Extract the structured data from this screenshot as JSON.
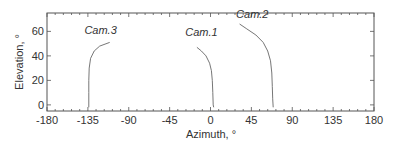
{
  "chart_data": {
    "type": "line",
    "title": "",
    "xlabel": "Azimuth, °",
    "ylabel": "Elevation, °",
    "xlim": [
      -180,
      180
    ],
    "ylim": [
      -5,
      75
    ],
    "xticks": [
      -180,
      -135,
      -90,
      -45,
      0,
      45,
      90,
      135,
      180
    ],
    "yticks": [
      0,
      20,
      40,
      60
    ],
    "grid": false,
    "legend": "none (inline labels)",
    "series": [
      {
        "name": "Cam.3",
        "label_pos": [
          -121,
          58
        ],
        "points": [
          [
            -134,
            -2
          ],
          [
            -134,
            10
          ],
          [
            -134,
            20
          ],
          [
            -133.5,
            30
          ],
          [
            -132,
            38
          ],
          [
            -128,
            44
          ],
          [
            -122,
            48
          ],
          [
            -111,
            51
          ]
        ]
      },
      {
        "name": "Cam.1",
        "label_pos": [
          -10,
          56
        ],
        "points": [
          [
            -15,
            47
          ],
          [
            -10,
            44
          ],
          [
            -5,
            40
          ],
          [
            -1,
            34
          ],
          [
            1,
            28
          ],
          [
            2,
            20
          ],
          [
            2.5,
            10
          ],
          [
            3,
            0
          ],
          [
            3.5,
            -2
          ]
        ]
      },
      {
        "name": "Cam.2",
        "label_pos": [
          46,
          71
        ],
        "points": [
          [
            32,
            66
          ],
          [
            40,
            62
          ],
          [
            50,
            57
          ],
          [
            58,
            51
          ],
          [
            63,
            44
          ],
          [
            66,
            36
          ],
          [
            67.5,
            26
          ],
          [
            68,
            15
          ],
          [
            68.5,
            5
          ],
          [
            69,
            -2
          ]
        ]
      }
    ]
  },
  "colors": {
    "axis": "#555555",
    "line": "#666666",
    "text": "#333333"
  }
}
